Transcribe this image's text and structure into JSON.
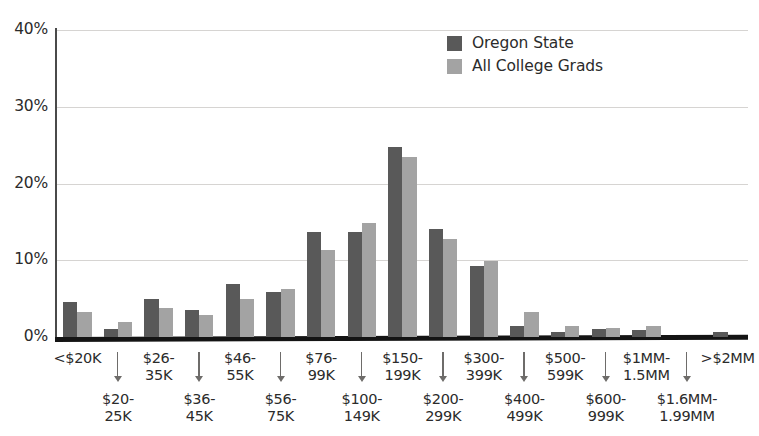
{
  "chart_data": {
    "type": "bar",
    "title": "",
    "subtitle": "",
    "xlabel": "",
    "ylabel": "",
    "ylim": [
      0,
      40
    ],
    "yticks": [
      0,
      10,
      20,
      30,
      40
    ],
    "ytick_labels": [
      "0%",
      "10%",
      "20%",
      "30%",
      "40%"
    ],
    "grid": true,
    "legend_position": "top-right",
    "categories": [
      "<$20K",
      "$20-\n25K",
      "$26-\n35K",
      "$36-\n45K",
      "$46-\n55K",
      "$56-\n75K",
      "$76-\n99K",
      "$100-\n149K",
      "$150-\n199K",
      "$200-\n299K",
      "$300-\n399K",
      "$400-\n499K",
      "$500-\n599K",
      "$600-\n999K",
      "$1MM-\n1.5MM",
      "$1.6MM-\n1.99MM",
      ">$2MM"
    ],
    "series": [
      {
        "name": "Oregon State",
        "color": "#595959",
        "values": [
          4.6,
          1.0,
          4.9,
          3.5,
          6.9,
          5.9,
          13.7,
          13.7,
          24.8,
          14.1,
          9.2,
          1.5,
          0.6,
          1.0,
          0.9,
          0.0,
          0.7
        ]
      },
      {
        "name": "All College Grads",
        "color": "#a3a3a3",
        "values": [
          3.2,
          2.0,
          3.8,
          2.9,
          4.9,
          6.2,
          11.3,
          14.8,
          23.4,
          12.8,
          9.9,
          3.3,
          1.4,
          1.2,
          1.4,
          0.0,
          0.0
        ]
      }
    ]
  },
  "legend": {
    "items": [
      {
        "label": "Oregon State",
        "color": "#595959"
      },
      {
        "label": "All College Grads",
        "color": "#a3a3a3"
      }
    ]
  },
  "axis": {
    "y_tick_labels": [
      "40%",
      "30%",
      "20%",
      "10%",
      "0%"
    ]
  },
  "x_axis_labels": [
    {
      "text": "<$20K",
      "row": "top"
    },
    {
      "text": "$20-\n25K",
      "row": "bottom"
    },
    {
      "text": "$26-\n35K",
      "row": "top"
    },
    {
      "text": "$36-\n45K",
      "row": "bottom"
    },
    {
      "text": "$46-\n55K",
      "row": "top"
    },
    {
      "text": "$56-\n75K",
      "row": "bottom"
    },
    {
      "text": "$76-\n99K",
      "row": "top"
    },
    {
      "text": "$100-\n149K",
      "row": "bottom"
    },
    {
      "text": "$150-\n199K",
      "row": "top"
    },
    {
      "text": "$200-\n299K",
      "row": "bottom"
    },
    {
      "text": "$300-\n399K",
      "row": "top"
    },
    {
      "text": "$400-\n499K",
      "row": "bottom"
    },
    {
      "text": "$500-\n599K",
      "row": "top"
    },
    {
      "text": "$600-\n999K",
      "row": "bottom"
    },
    {
      "text": "$1MM-\n1.5MM",
      "row": "top"
    },
    {
      "text": "$1.6MM-\n1.99MM",
      "row": "bottom"
    },
    {
      "text": ">$2MM",
      "row": "top"
    }
  ],
  "colors": {
    "series_dark": "#595959",
    "series_light": "#a3a3a3",
    "gridline": "#d6d4d2",
    "axis": "#141414",
    "text": "#2b2b2b"
  }
}
